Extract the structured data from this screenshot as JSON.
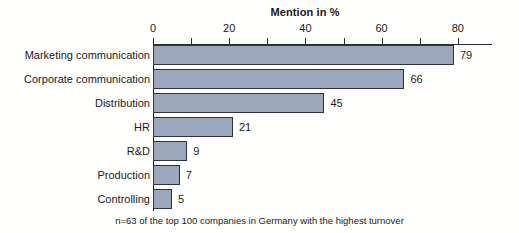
{
  "chart_data": {
    "type": "bar",
    "orientation": "horizontal",
    "title": "Mention in %",
    "xlabel": "",
    "ylabel": "",
    "categories": [
      "Marketing communication",
      "Corporate communication",
      "Distribution",
      "HR",
      "R&D",
      "Production",
      "Controlling"
    ],
    "values": [
      79,
      66,
      45,
      21,
      9,
      7,
      5
    ],
    "value_labels": [
      "79",
      "66",
      "45",
      "21",
      "9",
      "7",
      "5"
    ],
    "xlim": [
      0,
      89
    ],
    "xticks": [
      0,
      20,
      40,
      60,
      80
    ],
    "xtick_labels": [
      "0",
      "20",
      "40",
      "60",
      "80"
    ],
    "minor_tick_step": 10,
    "grid": false,
    "legend": null,
    "footnote": "n=63 of the top 100 companies in Germany with the highest turnover",
    "colors": {
      "bar_fill": "#9aa7bd",
      "bar_border": "#32323c",
      "axis": "#2b2b2b",
      "text": "#1a1a1a",
      "background": "#fffffd"
    }
  }
}
